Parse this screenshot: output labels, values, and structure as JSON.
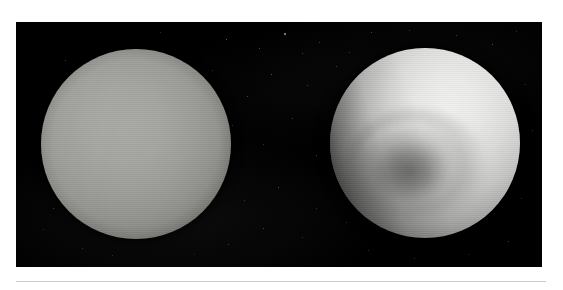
{
  "figure": {
    "type": "astronomical-image-plate",
    "view_count": 2,
    "background_color": "#000000",
    "page_background_color": "#ffffff",
    "divider_color": "#cbcbcb",
    "plate": {
      "x": 16,
      "y": 22,
      "width": 526,
      "height": 245
    },
    "panels": [
      {
        "id": "left",
        "label": "natural-color view",
        "description": "Smooth, featureless pale blue-gray disc of Uranus with gentle limb darkening",
        "center_x": 136,
        "center_y": 144,
        "radius": 95,
        "disc_color": "#a9a9a5",
        "limb_color": "#2a2a28",
        "contrast": "natural"
      },
      {
        "id": "right",
        "label": "contrast-enhanced view",
        "description": "Extreme contrast-enhanced false-color view revealing the dark polar hood, concentric banding and a bright limb crescent",
        "center_x": 425,
        "center_y": 143,
        "radius": 95,
        "disc_color": "#eaeae8",
        "hood_color": "#3c3c3a",
        "limb_color": "#ffffff",
        "contrast": "enhanced"
      }
    ],
    "stars": [
      {
        "x": 210,
        "y": 17,
        "size": 1.4,
        "brightness": 0.55
      },
      {
        "x": 243,
        "y": 26,
        "size": 1.2,
        "brightness": 0.45
      },
      {
        "x": 268,
        "y": 11,
        "size": 1.6,
        "brightness": 0.7
      },
      {
        "x": 286,
        "y": 31,
        "size": 1.1,
        "brightness": 0.4
      },
      {
        "x": 255,
        "y": 52,
        "size": 1.3,
        "brightness": 0.5
      },
      {
        "x": 291,
        "y": 63,
        "size": 1.0,
        "brightness": 0.35
      },
      {
        "x": 231,
        "y": 74,
        "size": 1.2,
        "brightness": 0.42
      },
      {
        "x": 303,
        "y": 20,
        "size": 1.0,
        "brightness": 0.38
      },
      {
        "x": 320,
        "y": 44,
        "size": 1.1,
        "brightness": 0.36
      },
      {
        "x": 196,
        "y": 48,
        "size": 1.0,
        "brightness": 0.3
      },
      {
        "x": 216,
        "y": 103,
        "size": 1.3,
        "brightness": 0.48
      },
      {
        "x": 247,
        "y": 122,
        "size": 1.0,
        "brightness": 0.32
      },
      {
        "x": 276,
        "y": 96,
        "size": 1.1,
        "brightness": 0.38
      },
      {
        "x": 300,
        "y": 133,
        "size": 1.2,
        "brightness": 0.4
      },
      {
        "x": 190,
        "y": 160,
        "size": 1.1,
        "brightness": 0.36
      },
      {
        "x": 228,
        "y": 178,
        "size": 1.0,
        "brightness": 0.3
      },
      {
        "x": 262,
        "y": 165,
        "size": 1.4,
        "brightness": 0.55
      },
      {
        "x": 300,
        "y": 186,
        "size": 1.0,
        "brightness": 0.32
      },
      {
        "x": 247,
        "y": 206,
        "size": 1.2,
        "brightness": 0.42
      },
      {
        "x": 286,
        "y": 215,
        "size": 1.0,
        "brightness": 0.3
      },
      {
        "x": 212,
        "y": 222,
        "size": 1.1,
        "brightness": 0.35
      },
      {
        "x": 49,
        "y": 38,
        "size": 1.1,
        "brightness": 0.34
      },
      {
        "x": 37,
        "y": 186,
        "size": 1.2,
        "brightness": 0.4
      },
      {
        "x": 27,
        "y": 207,
        "size": 1.0,
        "brightness": 0.28
      },
      {
        "x": 66,
        "y": 226,
        "size": 1.1,
        "brightness": 0.33
      },
      {
        "x": 96,
        "y": 233,
        "size": 1.0,
        "brightness": 0.26
      },
      {
        "x": 355,
        "y": 10,
        "size": 1.2,
        "brightness": 0.42
      },
      {
        "x": 393,
        "y": 8,
        "size": 1.0,
        "brightness": 0.3
      },
      {
        "x": 440,
        "y": 13,
        "size": 1.1,
        "brightness": 0.36
      },
      {
        "x": 476,
        "y": 22,
        "size": 1.3,
        "brightness": 0.48
      },
      {
        "x": 500,
        "y": 9,
        "size": 1.0,
        "brightness": 0.3
      },
      {
        "x": 333,
        "y": 30,
        "size": 1.1,
        "brightness": 0.34
      },
      {
        "x": 509,
        "y": 62,
        "size": 1.0,
        "brightness": 0.28
      },
      {
        "x": 516,
        "y": 108,
        "size": 1.1,
        "brightness": 0.32
      },
      {
        "x": 505,
        "y": 176,
        "size": 1.0,
        "brightness": 0.28
      },
      {
        "x": 492,
        "y": 219,
        "size": 1.2,
        "brightness": 0.38
      },
      {
        "x": 452,
        "y": 232,
        "size": 1.0,
        "brightness": 0.26
      },
      {
        "x": 398,
        "y": 236,
        "size": 1.1,
        "brightness": 0.3
      },
      {
        "x": 352,
        "y": 228,
        "size": 1.0,
        "brightness": 0.26
      },
      {
        "x": 330,
        "y": 200,
        "size": 1.1,
        "brightness": 0.3
      },
      {
        "x": 144,
        "y": 10,
        "size": 1.0,
        "brightness": 0.26
      },
      {
        "x": 178,
        "y": 232,
        "size": 1.0,
        "brightness": 0.24
      }
    ]
  }
}
